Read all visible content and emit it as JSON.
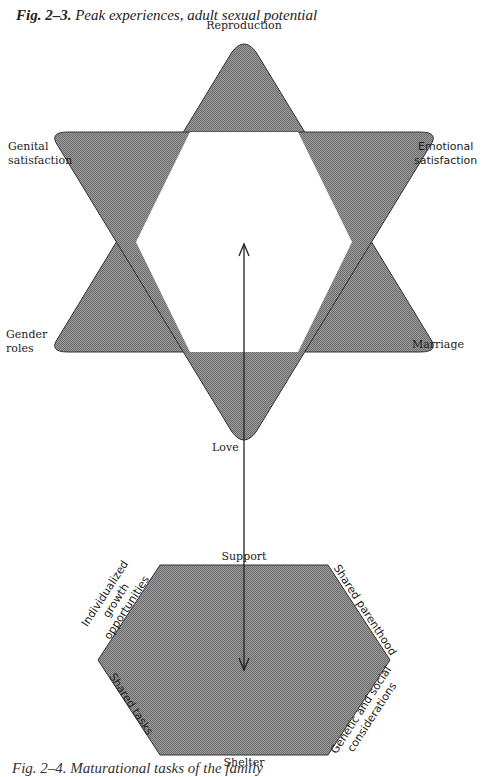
{
  "figure": {
    "number": "Fig. 2–3.",
    "title": "Peak experiences, adult sexual potential"
  },
  "star": {
    "shape": "hexagram",
    "fill": "#8c8c8c",
    "vertices": {
      "top": "Reproduction",
      "upper_left": "Genital satisfaction",
      "upper_left_line1": "Genital",
      "upper_left_line2": "satisfaction",
      "upper_right": "Emotional satisfaction",
      "upper_right_line1": "Emotional",
      "upper_right_line2": "satisfaction",
      "lower_left": "Gender roles",
      "lower_left_line1": "Gender",
      "lower_left_line2": "roles",
      "lower_right": "Marriage",
      "bottom": "Love"
    }
  },
  "hexagon": {
    "fill": "#8c8c8c",
    "sides": {
      "top": "Support",
      "upper_right": "Shared parenthood",
      "lower_right_line1": "Genetic and social",
      "lower_right_line2": "considerations",
      "bottom": "Shelter",
      "lower_left": "Shared tasks",
      "upper_left_line1": "Individualized",
      "upper_left_line2": "growth",
      "upper_left_line3": "opportunities"
    }
  },
  "arrow": {
    "description": "double-headed vertical arrow linking star center and hexagon center"
  },
  "bottom_caption": {
    "text": "Fig. 2–4. Maturational tasks of the family"
  }
}
